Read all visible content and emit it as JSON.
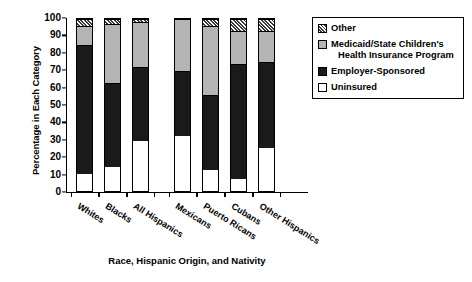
{
  "chart_data": {
    "type": "bar",
    "subtype": "stacked-bar-100-percent",
    "title": "",
    "xlabel": "Race, Hispanic Origin, and Nativity",
    "ylabel": "Percentage in Each Category",
    "ylim": [
      0,
      100
    ],
    "ytick_step": 10,
    "yticks": [
      "100",
      "90",
      "80",
      "70",
      "60",
      "50",
      "40",
      "30",
      "20",
      "10",
      "0"
    ],
    "grid": false,
    "legend_position": "right",
    "categories": [
      "Whites",
      "Blacks",
      "All Hispanics",
      "Mexicans",
      "Puerto Ricans",
      "Cubans",
      "Other Hispanics"
    ],
    "group_gap_after_index": 2,
    "series": [
      {
        "name": "Uninsured",
        "color": "#ffffff",
        "pattern": "solid",
        "values": [
          10,
          14,
          29,
          32,
          12,
          7,
          25
        ]
      },
      {
        "name": "Employer-Sponsored",
        "color": "#1a1a1a",
        "pattern": "solid",
        "values": [
          75,
          49,
          43,
          38,
          44,
          67,
          50
        ]
      },
      {
        "name": "Medicaid/State Children's Health Insurance Program",
        "color": "#b4b4b4",
        "pattern": "solid",
        "values": [
          11,
          34,
          26,
          30,
          40,
          19,
          18
        ]
      },
      {
        "name": "Other",
        "color": "#ffffff",
        "pattern": "diagonal-hatch",
        "values": [
          4,
          3,
          2,
          0,
          4,
          7,
          7
        ]
      }
    ],
    "cumulative_tops": [
      [
        10,
        85,
        96,
        100
      ],
      [
        14,
        63,
        97,
        100
      ],
      [
        29,
        72,
        98,
        100
      ],
      [
        32,
        70,
        100,
        100
      ],
      [
        12,
        56,
        96,
        100
      ],
      [
        7,
        74,
        93,
        100
      ],
      [
        25,
        75,
        93,
        100
      ]
    ]
  },
  "legend": {
    "entries": [
      {
        "label": "Other",
        "label2": ""
      },
      {
        "label": "Medicaid/State Children's",
        "label2": "Health Insurance Program"
      },
      {
        "label": "Employer-Sponsored",
        "label2": ""
      },
      {
        "label": "Uninsured",
        "label2": ""
      }
    ]
  }
}
